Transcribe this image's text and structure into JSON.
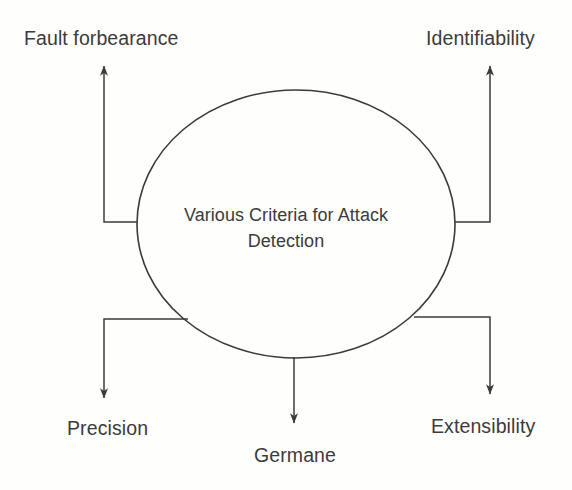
{
  "diagram": {
    "type": "hub-and-spoke",
    "center": {
      "shape": "ellipse",
      "line1": "Various Criteria for Attack",
      "line2": "Detection",
      "full_text": "Various Criteria for Attack Detection"
    },
    "nodes": [
      {
        "id": "fault-forbearance",
        "label": "Fault forbearance",
        "position": "top-left",
        "arrow_direction": "up"
      },
      {
        "id": "identifiability",
        "label": "Identifiability",
        "position": "top-right",
        "arrow_direction": "up"
      },
      {
        "id": "precision",
        "label": "Precision",
        "position": "bottom-left",
        "arrow_direction": "down"
      },
      {
        "id": "germane",
        "label": "Germane",
        "position": "bottom-center",
        "arrow_direction": "down"
      },
      {
        "id": "extensibility",
        "label": "Extensibility",
        "position": "bottom-right",
        "arrow_direction": "down"
      }
    ],
    "colors": {
      "background": "#fefefd",
      "stroke": "#3b3b3b",
      "text": "#3b3b3b"
    }
  }
}
